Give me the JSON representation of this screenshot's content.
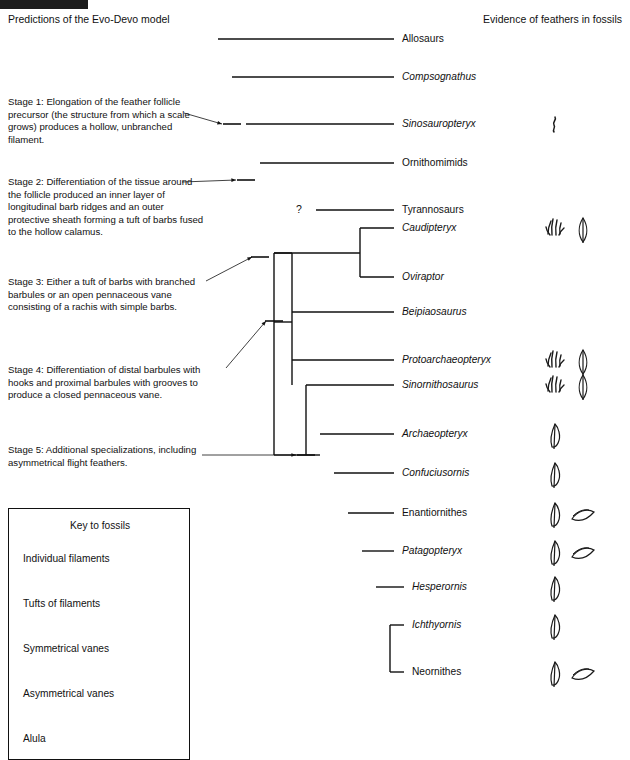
{
  "topbar": {
    "color": "#1c1c1c"
  },
  "header": {
    "left": "Predictions of the Evo-Devo model",
    "right": "Evidence of feathers in fossils"
  },
  "stages": [
    {
      "id": "stage-1",
      "label": "Stage 1",
      "text": "Stage 1: Elongation of the feather follicle precursor (the structure from which a scale grows) produces a hollow, unbranched filament."
    },
    {
      "id": "stage-2",
      "label": "Stage 2",
      "text": "Stage 2: Differentiation of the tissue around the follicle produced an inner layer of longitudinal barb ridges and an outer protective sheath forming a tuft of barbs fused to the hollow calamus."
    },
    {
      "id": "stage-3",
      "label": "Stage 3",
      "text": "Stage 3: Either a tuft of barbs with branched barbules or an open pennaceous vane consisting of a rachis with simple barbs."
    },
    {
      "id": "stage-4",
      "label": "Stage 4",
      "text": "Stage 4: Differentiation of distal barbules with hooks and proximal barbules with grooves to produce a closed pennaceous vane."
    },
    {
      "id": "stage-5",
      "label": "Stage 5",
      "text": "Stage 5: Additional specializations, including asymmetrical flight feathers."
    }
  ],
  "uncertainty_marker": "?",
  "taxa": [
    {
      "name": "Allosaurs",
      "italic": false,
      "y": 39,
      "tip_x": 394,
      "fossils": []
    },
    {
      "name": "Compsognathus",
      "italic": true,
      "y": 77,
      "tip_x": 394,
      "fossils": []
    },
    {
      "name": "Sinosauropteryx",
      "italic": true,
      "y": 124,
      "tip_x": 394,
      "fossils": [
        "individual-filaments"
      ]
    },
    {
      "name": "Ornithomimids",
      "italic": false,
      "y": 163,
      "tip_x": 394,
      "fossils": []
    },
    {
      "name": "Tyrannosaurs",
      "italic": false,
      "y": 210,
      "tip_x": 394,
      "fossils": []
    },
    {
      "name": "Caudipteryx",
      "italic": true,
      "y": 228,
      "tip_x": 394,
      "fossils": [
        "tufts-of-filaments",
        "symmetrical-vanes"
      ]
    },
    {
      "name": "Oviraptor",
      "italic": true,
      "y": 277,
      "tip_x": 394,
      "fossils": []
    },
    {
      "name": "Beipiaosaurus",
      "italic": true,
      "y": 312,
      "tip_x": 394,
      "fossils": []
    },
    {
      "name": "Protoarchaeopteryx",
      "italic": true,
      "y": 360,
      "tip_x": 394,
      "fossils": [
        "tufts-of-filaments",
        "symmetrical-vanes"
      ]
    },
    {
      "name": "Sinornithosaurus",
      "italic": true,
      "y": 385,
      "tip_x": 394,
      "fossils": [
        "tufts-of-filaments",
        "symmetrical-vanes"
      ]
    },
    {
      "name": "Archaeopteryx",
      "italic": true,
      "y": 434,
      "tip_x": 394,
      "fossils": [
        "asymmetrical-vanes"
      ]
    },
    {
      "name": "Confuciusornis",
      "italic": true,
      "y": 473,
      "tip_x": 394,
      "fossils": [
        "asymmetrical-vanes"
      ]
    },
    {
      "name": "Enantiornithes",
      "italic": false,
      "y": 513,
      "tip_x": 394,
      "fossils": [
        "asymmetrical-vanes",
        "alula"
      ]
    },
    {
      "name": "Patagopteryx",
      "italic": true,
      "y": 551,
      "tip_x": 394,
      "fossils": [
        "asymmetrical-vanes",
        "alula"
      ]
    },
    {
      "name": "Hesperornis",
      "italic": true,
      "y": 587,
      "tip_x": 404,
      "fossils": [
        "asymmetrical-vanes"
      ]
    },
    {
      "name": "Ichthyornis",
      "italic": true,
      "y": 625,
      "tip_x": 404,
      "fossils": [
        "asymmetrical-vanes"
      ]
    },
    {
      "name": "Neornithes",
      "italic": false,
      "y": 672,
      "tip_x": 404,
      "fossils": [
        "asymmetrical-vanes",
        "alula"
      ]
    }
  ],
  "key": {
    "title": "Key to fossils",
    "items": [
      {
        "label": "Individual filaments",
        "icon": "individual-filaments"
      },
      {
        "label": "Tufts of filaments",
        "icon": "tufts-of-filaments"
      },
      {
        "label": "Symmetrical vanes",
        "icon": "symmetrical-vanes"
      },
      {
        "label": "Asymmetrical vanes",
        "icon": "asymmetrical-vanes"
      },
      {
        "label": "Alula",
        "icon": "alula"
      }
    ]
  },
  "tree": {
    "line_color": "#111111",
    "nodes": [
      {
        "name": "root",
        "x": 218,
        "y_top": 39,
        "y_bot": 140
      },
      {
        "name": "node-stage1",
        "x": 232,
        "y_top": 77,
        "y_bot": 150
      },
      {
        "name": "node-stage2",
        "x": 246,
        "y_top": 124,
        "y_bot": 186
      },
      {
        "name": "node-coelur",
        "x": 260,
        "y_top": 163,
        "y_bot": 258
      },
      {
        "name": "node-stage3",
        "x": 274,
        "y_top": 228,
        "y_bot": 322
      },
      {
        "name": "node-oviraptor",
        "x": 360,
        "y_top": 228,
        "y_bot": 277
      },
      {
        "name": "node-maniraptor",
        "x": 292,
        "y_top": 253,
        "y_bot": 385
      },
      {
        "name": "node-stage5",
        "x": 306,
        "y_top": 385,
        "y_bot": 455
      },
      {
        "name": "node-aves",
        "x": 320,
        "y_top": 434,
        "y_bot": 493
      },
      {
        "name": "node-orni",
        "x": 334,
        "y_top": 473,
        "y_bot": 532
      },
      {
        "name": "node-ornith",
        "x": 348,
        "y_top": 513,
        "y_bot": 569
      },
      {
        "name": "node-carinate",
        "x": 362,
        "y_top": 551,
        "y_bot": 606
      },
      {
        "name": "node-neorn",
        "x": 376,
        "y_top": 587,
        "y_bot": 648
      },
      {
        "name": "node-terminal",
        "x": 390,
        "y_top": 625,
        "y_bot": 672
      }
    ],
    "stage_markers": [
      {
        "stage": "Stage 1",
        "x": 232,
        "y": 124
      },
      {
        "stage": "Stage 2",
        "x": 246,
        "y": 180
      },
      {
        "stage": "Stage 3",
        "x": 260,
        "y": 257
      },
      {
        "stage": "Stage 4",
        "x": 274,
        "y": 321
      },
      {
        "stage": "Stage 5",
        "x": 306,
        "y": 455
      }
    ]
  }
}
